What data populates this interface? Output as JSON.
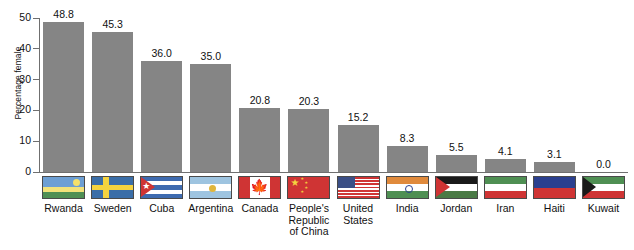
{
  "chart_data": {
    "type": "bar",
    "title": "",
    "xlabel": "",
    "ylabel": "Percentage female",
    "ylim": [
      0,
      50
    ],
    "yticks": [
      "0",
      "10",
      "20",
      "30",
      "40",
      "50"
    ],
    "grid": false,
    "legend": "none",
    "categories": [
      "Rwanda",
      "Sweden",
      "Cuba",
      "Argentina",
      "Canada",
      "People's Republic of China",
      "United States",
      "India",
      "Jordan",
      "Iran",
      "Haiti",
      "Kuwait"
    ],
    "category_labels": [
      "Rwanda",
      "Sweden",
      "Cuba",
      "Argentina",
      "Canada",
      "People's\nRepublic\nof China",
      "United\nStates",
      "India",
      "Jordan",
      "Iran",
      "Haiti",
      "Kuwait"
    ],
    "values": [
      48.8,
      45.3,
      36.0,
      35.0,
      20.8,
      20.3,
      15.2,
      8.3,
      5.5,
      4.1,
      3.1,
      0.0
    ],
    "value_labels": [
      "48.8",
      "45.3",
      "36.0",
      "35.0",
      "20.8",
      "20.3",
      "15.2",
      "8.3",
      "5.5",
      "4.1",
      "3.1",
      "0.0"
    ],
    "flag_names": [
      "rwanda-flag",
      "sweden-flag",
      "cuba-flag",
      "argentina-flag",
      "canada-flag",
      "china-flag",
      "united-states-flag",
      "india-flag",
      "jordan-flag",
      "iran-flag",
      "haiti-flag",
      "kuwait-flag"
    ]
  },
  "colors": {
    "bar_fill": "#858585",
    "axis": "#6f6f6f",
    "text": "#111111",
    "background": "#ffffff"
  }
}
